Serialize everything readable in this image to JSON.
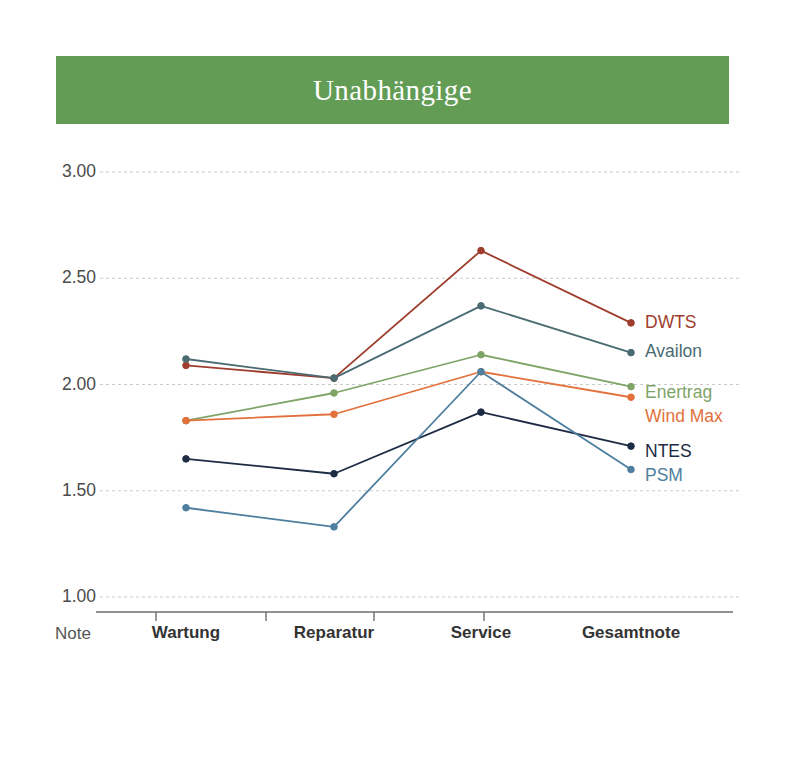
{
  "header": {
    "title": "Unabhängige",
    "banner_color": "#629c55",
    "title_color": "#ffffff"
  },
  "axis": {
    "corner_label": "Note",
    "y_ticks": [
      "3.00",
      "2.50",
      "2.00",
      "1.50",
      "1.00"
    ],
    "x_ticks": [
      "Wartung",
      "Reparatur",
      "Service",
      "Gesamtnote"
    ]
  },
  "legend": {
    "position": "right",
    "entries": [
      {
        "name": "DWTS",
        "color": "#9e3d2c"
      },
      {
        "name": "Availon",
        "color": "#4a6b72"
      },
      {
        "name": "Enertrag",
        "color": "#7fa468"
      },
      {
        "name": "Wind Max",
        "color": "#e2713c"
      },
      {
        "name": "NTES",
        "color": "#1d2b45"
      },
      {
        "name": "PSM",
        "color": "#4e7f9e"
      }
    ]
  },
  "chart_data": {
    "type": "line",
    "title": "Unabhängige",
    "xlabel": "Note",
    "ylabel": "",
    "categories": [
      "Wartung",
      "Reparatur",
      "Service",
      "Gesamtnote"
    ],
    "ylim": [
      1.0,
      3.0
    ],
    "yticks": [
      1.0,
      1.5,
      2.0,
      2.5,
      3.0
    ],
    "grid": true,
    "legend": "right-inline",
    "series": [
      {
        "name": "DWTS",
        "color": "#9e3d2c",
        "values": [
          2.09,
          2.03,
          2.63,
          2.29
        ]
      },
      {
        "name": "Availon",
        "color": "#4a6b72",
        "values": [
          2.12,
          2.03,
          2.37,
          2.15
        ]
      },
      {
        "name": "Enertrag",
        "color": "#7fa468",
        "values": [
          1.83,
          1.96,
          2.14,
          1.99
        ]
      },
      {
        "name": "Wind Max",
        "color": "#e2713c",
        "values": [
          1.83,
          1.86,
          2.06,
          1.94
        ]
      },
      {
        "name": "NTES",
        "color": "#1d2b45",
        "values": [
          1.65,
          1.58,
          1.87,
          1.71
        ]
      },
      {
        "name": "PSM",
        "color": "#4e7f9e",
        "values": [
          1.42,
          1.33,
          2.06,
          1.6
        ]
      }
    ]
  },
  "geometry": {
    "plot_left": 96,
    "plot_right": 733,
    "axis_y": 612,
    "y_top_value": 3.0,
    "y_top_px": 172,
    "px_per_unit": 212.5,
    "category_x": [
      186,
      334,
      481,
      631
    ]
  }
}
